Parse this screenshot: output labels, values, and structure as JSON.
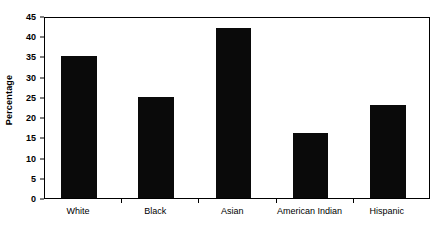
{
  "chart_data": {
    "type": "bar",
    "title": "",
    "subtitle": "",
    "xlabel": "",
    "ylabel": "Percentage",
    "categories": [
      "White",
      "Black",
      "Asian",
      "American Indian",
      "Hispanic"
    ],
    "values": [
      35,
      25,
      42,
      16,
      23
    ],
    "series": [
      {
        "name": "Percentage",
        "values": [
          35,
          25,
          42,
          16,
          23
        ]
      }
    ],
    "ylim": [
      0,
      45
    ],
    "ytick_step": 5,
    "ytick_labels": [
      "0",
      "5",
      "10",
      "15",
      "20",
      "25",
      "30",
      "35",
      "40",
      "45"
    ],
    "ytick_values": [
      0,
      5,
      10,
      15,
      20,
      25,
      30,
      35,
      40,
      45
    ],
    "grid": false,
    "legend": false,
    "legend_position": "none",
    "bar_color": "#0a0a0a",
    "frame_color": "#000000",
    "background_color": "#ffffff",
    "annotations": []
  }
}
